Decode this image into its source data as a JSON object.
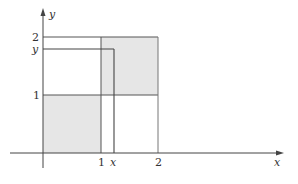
{
  "diagram": {
    "axes": {
      "x_label": "x",
      "y_label": "y"
    },
    "x_ticks": [
      {
        "label": "1",
        "value": 1
      },
      {
        "label": "x",
        "value": 1.22
      },
      {
        "label": "2",
        "value": 2
      }
    ],
    "y_ticks": [
      {
        "label": "2",
        "value": 2
      },
      {
        "label": "y",
        "value": 1.79
      },
      {
        "label": "1",
        "value": 1
      }
    ],
    "shaded_regions": [
      {
        "name": "lower-left-square",
        "x": [
          0,
          1
        ],
        "y": [
          0,
          1
        ]
      },
      {
        "name": "upper-right-square",
        "x": [
          1,
          2
        ],
        "y": [
          1,
          2
        ]
      }
    ],
    "colors": {
      "shade": "#e6e6e6",
      "line": "#555555",
      "axis": "#444444"
    }
  }
}
